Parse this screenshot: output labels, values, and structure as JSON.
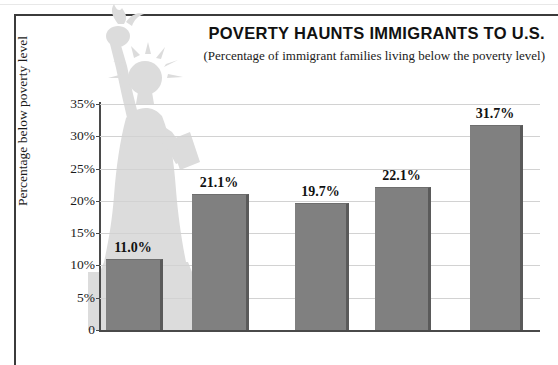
{
  "chart_data": {
    "type": "bar",
    "title": "POVERTY HAUNTS IMMIGRANTS TO U.S.",
    "subtitle": "(Percentage of immigrant families living below the poverty level)",
    "xlabel": "",
    "ylabel": "Percentage below poverty level",
    "categories": [
      "Pre-1980",
      "1980–1981",
      "1982–1984",
      "1985–1986",
      "1987–1990"
    ],
    "values": [
      11.0,
      21.1,
      19.7,
      22.1,
      31.7
    ],
    "value_labels": [
      "11.0%",
      "21.1%",
      "19.7%",
      "22.1%",
      "31.7%"
    ],
    "ylim": [
      0,
      35
    ],
    "ytick_values": [
      0,
      5,
      10,
      15,
      20,
      25,
      30,
      35
    ],
    "ytick_labels": [
      "0",
      "5%",
      "10%",
      "15%",
      "20%",
      "25%",
      "30%",
      "35%"
    ],
    "grid": true,
    "legend": "none",
    "bar_color": "#808080",
    "bar_shadow_color": "#5a5a5a",
    "gridline_color": "#d2d2d2",
    "axis_color": "#4a4a4a",
    "watermark": "statue-of-liberty"
  }
}
